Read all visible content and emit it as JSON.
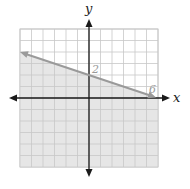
{
  "chart_data": {
    "type": "line",
    "title": "",
    "xlabel": "x",
    "ylabel": "y",
    "xlim": [
      -6,
      6
    ],
    "ylim": [
      -6,
      6
    ],
    "grid": true,
    "grid_step": 1,
    "series": [
      {
        "name": "boundary line",
        "equation": "y = -x/3 + 2",
        "x": [
          -6,
          0,
          6
        ],
        "y": [
          4,
          2,
          0
        ],
        "style": "solid",
        "arrow_left": true,
        "arrow_right": true
      }
    ],
    "shaded_region": "below line (y <= -x/3 + 2)",
    "annotations": [
      {
        "text": "2",
        "x": 0,
        "y": 2
      },
      {
        "text": "6",
        "x": 6,
        "y": 0
      }
    ]
  },
  "labels": {
    "x_axis": "x",
    "y_axis": "y",
    "y_intercept": "2",
    "x_intercept": "6"
  },
  "colors": {
    "grid": "#c8c8c8",
    "shade": "#e6e6e6",
    "axis": "#1a1a1a",
    "line": "#9a9a9a",
    "annotation": "#9a9a9a"
  }
}
